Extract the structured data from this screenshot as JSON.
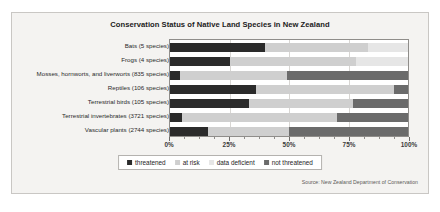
{
  "top_caption": "",
  "figure": {
    "title": "Conservation Status of Native Land Species in New Zealand",
    "source": "Source: New Zealand Department of Conservation"
  },
  "legend": {
    "items": [
      {
        "label": "threatened",
        "color": "#2b2b2b"
      },
      {
        "label": "at risk",
        "color": "#cfcfcf"
      },
      {
        "label": "data deficient",
        "color": "#e6e6e6"
      },
      {
        "label": "not threatened",
        "color": "#6b6b6b"
      }
    ]
  },
  "chart_data": {
    "type": "bar",
    "orientation": "horizontal",
    "stacked": true,
    "stack_mode": "percent",
    "title": "Conservation Status of Native Land Species in New Zealand",
    "xlabel": "",
    "ylabel": "",
    "xlim": [
      0,
      100
    ],
    "xticks": [
      0,
      25,
      50,
      75,
      100
    ],
    "xticklabels": [
      "0%",
      "25%",
      "50%",
      "75%",
      "100%"
    ],
    "xminorticks": [
      6.25,
      12.5,
      18.75,
      31.25,
      37.5,
      43.75,
      56.25,
      62.5,
      68.75,
      81.25,
      87.5,
      93.75
    ],
    "grid": true,
    "grid_axis": "x",
    "legend_position": "bottom",
    "categories": [
      "Bats (5 species)",
      "Frogs (4 species)",
      "Mosses, hornworts, and liverworts (835 species)",
      "Reptiles (106 species)",
      "Terrestrial birds (105 species)",
      "Terrestrial invertebrates (3721 species)",
      "Vascular plants (2744 species)"
    ],
    "series": [
      {
        "name": "threatened",
        "color": "#2b2b2b",
        "values": [
          40,
          25,
          4,
          36,
          33,
          5,
          16
        ]
      },
      {
        "name": "at risk",
        "color": "#cfcfcf",
        "values": [
          43,
          53,
          45,
          58,
          44,
          65,
          34
        ]
      },
      {
        "name": "data deficient",
        "color": "#e6e6e6",
        "values": [
          17,
          22,
          0,
          0,
          0,
          0,
          0
        ]
      },
      {
        "name": "not threatened",
        "color": "#6b6b6b",
        "values": [
          0,
          0,
          51,
          6,
          23,
          30,
          50
        ]
      }
    ]
  }
}
